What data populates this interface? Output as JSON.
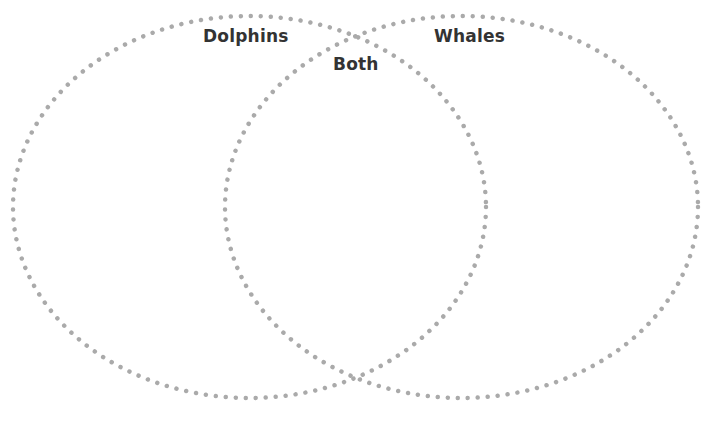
{
  "diagram": {
    "type": "venn",
    "labels": {
      "left": "Dolphins",
      "right": "Whales",
      "overlap": "Both"
    },
    "colors": {
      "outline": "#aaaaaa",
      "text": "#333333",
      "background": "#ffffff"
    },
    "outline_style": "dotted"
  }
}
